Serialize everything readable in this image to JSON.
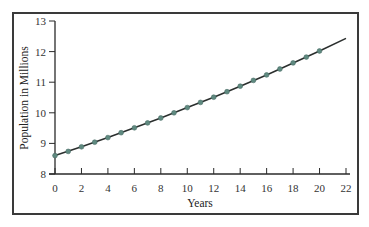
{
  "chart_data": {
    "type": "line",
    "title": "",
    "xlabel": "Years",
    "ylabel": "Population in Millions",
    "xlim": [
      0,
      22
    ],
    "ylim": [
      8,
      13
    ],
    "xticks": [
      0,
      2,
      4,
      6,
      8,
      10,
      12,
      14,
      16,
      18,
      20,
      22
    ],
    "yticks": [
      8,
      9,
      10,
      11,
      12,
      13
    ],
    "grid": false,
    "legend": null,
    "series": [
      {
        "name": "Population",
        "x": [
          0,
          1,
          2,
          3,
          4,
          5,
          6,
          7,
          8,
          9,
          10,
          11,
          12,
          13,
          14,
          15,
          16,
          17,
          18,
          19,
          20
        ],
        "values": [
          8.6,
          8.74,
          8.89,
          9.04,
          9.19,
          9.35,
          9.51,
          9.67,
          9.83,
          10.0,
          10.17,
          10.34,
          10.51,
          10.69,
          10.87,
          11.06,
          11.24,
          11.43,
          11.63,
          11.82,
          12.02
        ],
        "markers": true
      },
      {
        "name": "Fitted curve",
        "x": [
          0,
          2,
          4,
          6,
          8,
          10,
          12,
          14,
          16,
          18,
          20,
          22
        ],
        "values": [
          8.6,
          8.89,
          9.19,
          9.51,
          9.83,
          10.17,
          10.51,
          10.87,
          11.24,
          11.63,
          12.02,
          12.43
        ],
        "markers": false
      }
    ],
    "colors": {
      "curve": "#2b2f2e",
      "marker": "#5f8a80",
      "frame": "#3a3a3a"
    }
  },
  "labels": {
    "x_axis": "Years",
    "y_axis": "Population in Millions",
    "x_ticks": [
      "0",
      "2",
      "4",
      "6",
      "8",
      "10",
      "12",
      "14",
      "16",
      "18",
      "20",
      "22"
    ],
    "y_ticks": [
      "8",
      "9",
      "10",
      "11",
      "12",
      "13"
    ]
  }
}
